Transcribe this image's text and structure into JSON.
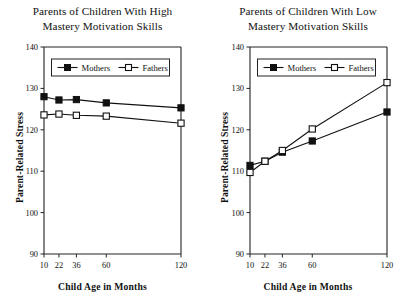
{
  "figure": {
    "background_color": "#ffffff",
    "series_color": "#111111"
  },
  "panels": [
    {
      "id": "high-mastery",
      "title_line1": "Parents of Children With High",
      "title_line2": "Mastery Motivation Skills",
      "xlabel": "Child Age in Months",
      "ylabel": "Parent-Related Stress",
      "legend": [
        "Mothers",
        "Fathers"
      ],
      "ytick_labels": [
        "90",
        "100",
        "110",
        "120",
        "130",
        "140"
      ],
      "xtick_labels": [
        "10",
        "22",
        "36",
        "60",
        "120"
      ]
    },
    {
      "id": "low-mastery",
      "title_line1": "Parents of Children With Low",
      "title_line2": "Mastery Motivation Skills",
      "xlabel": "Child Age in Months",
      "ylabel": "Parent-Related Stress",
      "legend": [
        "Mothers",
        "Fathers"
      ],
      "ytick_labels": [
        "90",
        "100",
        "110",
        "120",
        "130",
        "140"
      ],
      "xtick_labels": [
        "10",
        "22",
        "36",
        "60",
        "120"
      ]
    }
  ],
  "chart_data": [
    {
      "type": "line",
      "title": "Parents of Children With High Mastery Motivation Skills",
      "xlabel": "Child Age in Months",
      "ylabel": "Parent-Related Stress",
      "x": [
        10,
        22,
        36,
        60,
        120
      ],
      "xtick_labels": [
        "10",
        "22",
        "36",
        "60",
        "120"
      ],
      "xlim": [
        10,
        120
      ],
      "ylim": [
        90,
        140
      ],
      "yticks": [
        90,
        100,
        110,
        120,
        130,
        140
      ],
      "grid": false,
      "legend_position": "upper center",
      "series": [
        {
          "name": "Mothers",
          "marker": "filled-square",
          "values": [
            128.0,
            127.2,
            127.3,
            126.5,
            125.3
          ]
        },
        {
          "name": "Fathers",
          "marker": "open-square",
          "values": [
            123.6,
            123.8,
            123.5,
            123.3,
            121.6
          ]
        }
      ]
    },
    {
      "type": "line",
      "title": "Parents of Children With Low Mastery Motivation Skills",
      "xlabel": "Child Age in Months",
      "ylabel": "Parent-Related Stress",
      "x": [
        10,
        22,
        36,
        60,
        120
      ],
      "xtick_labels": [
        "10",
        "22",
        "36",
        "60",
        "120"
      ],
      "xlim": [
        10,
        120
      ],
      "ylim": [
        90,
        140
      ],
      "yticks": [
        90,
        100,
        110,
        120,
        130,
        140
      ],
      "grid": false,
      "legend_position": "upper center",
      "series": [
        {
          "name": "Mothers",
          "marker": "filled-square",
          "values": [
            111.4,
            112.4,
            114.6,
            117.3,
            124.3
          ]
        },
        {
          "name": "Fathers",
          "marker": "open-square",
          "values": [
            109.7,
            112.4,
            115.0,
            120.2,
            131.4
          ]
        }
      ]
    }
  ]
}
